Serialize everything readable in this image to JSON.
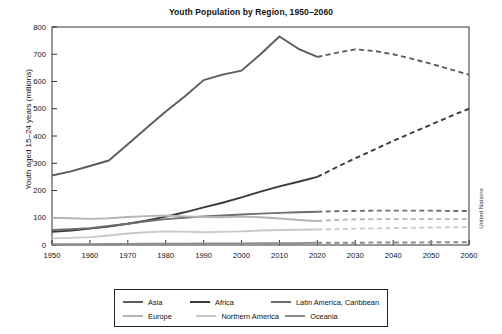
{
  "chart_data": {
    "type": "line",
    "title": "Youth Population by Region, 1950–2060",
    "xlabel": "",
    "ylabel": "Youth aged 15–24 years (millions)",
    "xlim": [
      1950,
      2060
    ],
    "ylim": [
      0,
      800
    ],
    "yticks": [
      0,
      100,
      200,
      300,
      400,
      500,
      600,
      700,
      800
    ],
    "xticks": [
      1950,
      1960,
      1970,
      1980,
      1990,
      2000,
      2010,
      2020,
      2030,
      2040,
      2050,
      2060
    ],
    "grid": false,
    "legend_position": "bottom",
    "annotations": [
      "United Nations"
    ],
    "projection_start_year": 2020,
    "projection_style": "dashed",
    "x": [
      1950,
      1955,
      1960,
      1965,
      1970,
      1975,
      1980,
      1985,
      1990,
      1995,
      2000,
      2005,
      2010,
      2015,
      2020,
      2025,
      2030,
      2035,
      2040,
      2045,
      2050,
      2055,
      2060
    ],
    "series": [
      {
        "name": "Asia",
        "color": "#5b5b5b",
        "values": [
          255,
          270,
          290,
          310,
          370,
          430,
          490,
          545,
          605,
          625,
          640,
          700,
          765,
          720,
          690,
          705,
          718,
          712,
          700,
          683,
          665,
          645,
          625
        ]
      },
      {
        "name": "Africa",
        "color": "#3a3a3a",
        "values": [
          48,
          53,
          60,
          68,
          78,
          90,
          104,
          120,
          138,
          155,
          175,
          196,
          215,
          232,
          250,
          285,
          318,
          350,
          382,
          412,
          442,
          472,
          500
        ]
      },
      {
        "name": "Latin America, Caribbean",
        "color": "#6e6e6e",
        "values": [
          55,
          58,
          62,
          70,
          78,
          87,
          95,
          100,
          105,
          108,
          112,
          115,
          118,
          120,
          122,
          124,
          125,
          126,
          126,
          126,
          126,
          125,
          125
        ]
      },
      {
        "name": "Europe",
        "color": "#b5b5b5",
        "values": [
          100,
          98,
          96,
          98,
          103,
          106,
          108,
          105,
          103,
          102,
          104,
          102,
          97,
          92,
          88,
          92,
          94,
          95,
          95,
          95,
          95,
          95,
          95
        ]
      },
      {
        "name": "Northern America",
        "color": "#c9c9c9",
        "values": [
          25,
          26,
          29,
          35,
          42,
          47,
          50,
          49,
          47,
          48,
          50,
          53,
          55,
          56,
          57,
          58,
          60,
          61,
          62,
          63,
          64,
          65,
          65
        ]
      },
      {
        "name": "Oceania",
        "color": "#8c8c8c",
        "values": [
          3,
          3,
          3,
          4,
          4,
          5,
          5,
          5,
          6,
          6,
          6,
          7,
          7,
          7,
          8,
          8,
          8,
          9,
          9,
          9,
          10,
          10,
          10
        ]
      }
    ]
  },
  "title": "Youth Population by Region, 1950–2060",
  "axes": {
    "ylabel": "Youth aged 15–24 years (millions)",
    "ytick_labels": [
      "800",
      "700",
      "600",
      "500",
      "400",
      "300",
      "200",
      "100",
      "0"
    ],
    "xtick_labels": [
      "1950",
      "1960",
      "1970",
      "1980",
      "1990",
      "2000",
      "2010",
      "2020",
      "2030",
      "2040",
      "2050",
      "2060"
    ]
  },
  "source": {
    "label": "United Nations"
  },
  "legend": {
    "rows": [
      [
        {
          "label": "Asia",
          "color": "#5b5b5b"
        },
        {
          "label": "Africa",
          "color": "#3a3a3a"
        },
        {
          "label": "Latin America, Caribbean",
          "color": "#6e6e6e"
        }
      ],
      [
        {
          "label": "Europe",
          "color": "#b5b5b5"
        },
        {
          "label": "Northern America",
          "color": "#c9c9c9"
        },
        {
          "label": "Oceania",
          "color": "#8c8c8c"
        }
      ]
    ]
  }
}
